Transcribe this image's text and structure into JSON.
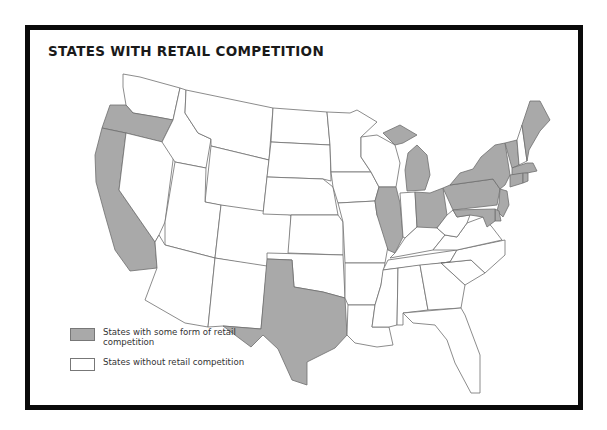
{
  "title": "STATES WITH RETAIL COMPETITION",
  "colors": {
    "shaded": "#a9a9a9",
    "unshaded": "#ffffff",
    "border": "#0a0a0a",
    "state_outline": "#6e6e6e"
  },
  "legend": {
    "items": [
      {
        "label": "States with some form of retail competition",
        "color": "#a9a9a9"
      },
      {
        "label": "States without retail competition",
        "color": "#ffffff"
      }
    ]
  },
  "map": {
    "shaded_states": [
      "Oregon",
      "California",
      "Texas",
      "Illinois",
      "Michigan",
      "Ohio",
      "Pennsylvania",
      "New York",
      "Vermont",
      "Maine",
      "Massachusetts",
      "Rhode Island",
      "Connecticut",
      "New Jersey",
      "Delaware",
      "Maryland",
      "District of Columbia"
    ],
    "unshaded_states": [
      "Washington",
      "Idaho",
      "Montana",
      "Wyoming",
      "Nevada",
      "Utah",
      "Arizona",
      "Colorado",
      "New Mexico",
      "North Dakota",
      "South Dakota",
      "Nebraska",
      "Kansas",
      "Oklahoma",
      "Minnesota",
      "Iowa",
      "Missouri",
      "Arkansas",
      "Louisiana",
      "Wisconsin",
      "Indiana",
      "Kentucky",
      "Tennessee",
      "Mississippi",
      "Alabama",
      "Georgia",
      "Florida",
      "South Carolina",
      "North Carolina",
      "Virginia",
      "West Virginia",
      "New Hampshire"
    ]
  }
}
